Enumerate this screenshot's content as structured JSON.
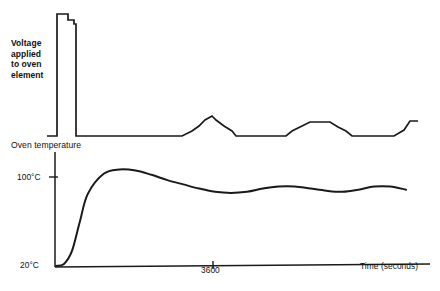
{
  "figure": {
    "background_color": "#ffffff",
    "ink_color": "#1a1a1a",
    "voltage_panel_label": "Voltage\napplied\nto oven\nelement",
    "temperature_panel_label": "Oven temperature"
  },
  "chart_data": {
    "type": "line",
    "title": "",
    "subtitle": "",
    "xlabel": "Time (seconds)",
    "ylabel": "",
    "grid": false,
    "legend_position": "none",
    "annotations": [
      "Voltage applied to oven element",
      "Oven temperature"
    ],
    "panels": [
      {
        "name": "voltage-applied-to-oven-element",
        "type": "line",
        "plot_style": "step",
        "ylabel": "Voltage applied to oven element",
        "ytick_labels": [],
        "xtick_labels": [],
        "description": "On/off thermostat drive: one long full-power pulse at start-up, then short proportional bursts once the oven approaches setpoint.",
        "x": [
          55,
          57,
          57,
          68,
          68,
          74,
          74,
          76,
          76,
          182,
          182,
          192,
          192,
          199,
          199,
          205,
          205,
          212,
          212,
          216,
          216,
          224,
          224,
          232,
          232,
          236,
          236,
          286,
          286,
          292,
          292,
          300,
          300,
          310,
          310,
          330,
          330,
          338,
          338,
          346,
          346,
          352,
          352,
          394,
          394,
          404,
          404,
          410,
          410,
          418
        ],
        "y": [
          136,
          136,
          14,
          14,
          20,
          20,
          24,
          24,
          136,
          136,
          136,
          131,
          131,
          126,
          126,
          120,
          120,
          116,
          116,
          120,
          120,
          126,
          126,
          131,
          131,
          136,
          136,
          136,
          136,
          131,
          131,
          127,
          127,
          122,
          122,
          122,
          122,
          127,
          127,
          131,
          131,
          136,
          136,
          136,
          136,
          130,
          130,
          121,
          121,
          121
        ]
      },
      {
        "name": "oven-temperature",
        "type": "line",
        "plot_style": "smooth",
        "ylabel": "Oven temperature",
        "ytick_labels": [
          "20°C",
          "100°C"
        ],
        "ytick_values": [
          20,
          100
        ],
        "xtick_labels": [
          "3600"
        ],
        "xtick_values": [
          3600
        ],
        "description": "Second-order thermal response: rapid rise from ambient, overshoot above 100°C, then damped oscillation settling just below setpoint.",
        "time_seconds": [
          0,
          150,
          300,
          450,
          600,
          900,
          1200,
          1500,
          1800,
          2100,
          2400,
          2700,
          3000,
          3300,
          3600,
          3900,
          4200,
          4500,
          4800,
          5100,
          5400,
          5700,
          6000,
          6300,
          6600
        ],
        "temperature_celsius": [
          20,
          22,
          34,
          62,
          88,
          107,
          111,
          110,
          106,
          101,
          97,
          93,
          90,
          89,
          90,
          93,
          95,
          95,
          93,
          91,
          90,
          92,
          95,
          95,
          92
        ],
        "ylim": [
          20,
          120
        ],
        "xlim": [
          0,
          6900
        ],
        "setpoint_celsius": 100,
        "ambient_celsius": 20
      }
    ]
  },
  "labels": {
    "voltage_line_1": "Voltage",
    "voltage_line_2": "applied",
    "voltage_line_3": "to oven",
    "voltage_line_4": "element",
    "oven_temperature": "Oven temperature",
    "tick_100c": "100°C",
    "tick_20c": "20°C",
    "tick_3600": "3600",
    "xaxis_title": "Time (seconds)"
  }
}
